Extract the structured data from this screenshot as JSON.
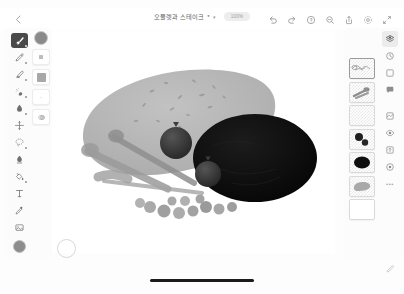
{
  "app": {
    "platform": "tablet-drawing-app",
    "background_color": "#fdfdfd"
  },
  "topbar": {
    "back_label": "‹",
    "back_icon": "chevron-left-icon",
    "document_title": "오믈렛과 스테이크",
    "title_modified_mark": "*",
    "title_caret": "▾",
    "zoom_level": "100%",
    "actions": [
      {
        "name": "undo",
        "icon": "undo-arrow-icon",
        "label": "실행 취소"
      },
      {
        "name": "redo",
        "icon": "redo-arrow-icon",
        "label": "다시 실행"
      },
      {
        "name": "help",
        "icon": "help-circle-icon",
        "label": "도움말"
      },
      {
        "name": "search",
        "icon": "search-zoom-icon",
        "label": "검색"
      },
      {
        "name": "share",
        "icon": "share-upload-icon",
        "label": "공유"
      },
      {
        "name": "settings",
        "icon": "gear-icon",
        "label": "설정"
      },
      {
        "name": "fullscreen",
        "icon": "expand-arrows-icon",
        "label": "전체 화면"
      }
    ]
  },
  "left_toolbar": {
    "tools": [
      {
        "name": "brush",
        "icon": "brush-icon",
        "label": "브러시",
        "active": true,
        "has_submenu": true
      },
      {
        "name": "pencil",
        "icon": "pencil-icon",
        "label": "연필",
        "active": false,
        "has_submenu": true
      },
      {
        "name": "marker",
        "icon": "marker-icon",
        "label": "마커",
        "active": false,
        "has_submenu": true
      },
      {
        "name": "airbrush",
        "icon": "airbrush-icon",
        "label": "에어브러시",
        "active": false,
        "has_submenu": true
      },
      {
        "name": "smudge",
        "icon": "smudge-icon",
        "label": "스머지",
        "active": false,
        "has_submenu": true
      },
      {
        "name": "transform",
        "icon": "transform-icon",
        "label": "변형",
        "active": false,
        "has_submenu": false
      },
      {
        "name": "selection",
        "icon": "lasso-select-icon",
        "label": "선택",
        "active": false,
        "has_submenu": true
      },
      {
        "name": "eraser",
        "icon": "eraser-icon",
        "label": "지우개",
        "active": false,
        "has_submenu": false
      },
      {
        "name": "fill",
        "icon": "paint-bucket-icon",
        "label": "채우기",
        "active": false,
        "has_submenu": true
      },
      {
        "name": "text",
        "icon": "text-tool-icon",
        "label": "텍스트",
        "active": false,
        "has_submenu": false
      },
      {
        "name": "eyedropper",
        "icon": "eyedropper-icon",
        "label": "스포이드",
        "active": false,
        "has_submenu": false
      },
      {
        "name": "image",
        "icon": "image-frame-icon",
        "label": "이미지",
        "active": false,
        "has_submenu": false
      }
    ],
    "color_swatch": {
      "name": "foreground-color",
      "color": "#8d8d8d",
      "label": "전경색"
    }
  },
  "tool_options": {
    "items": [
      {
        "name": "brush-color",
        "icon": "color-circle-icon",
        "color": "#8a8a8a",
        "label": "색상"
      },
      {
        "name": "brush-size",
        "icon": "size-square-icon",
        "label": "크기"
      },
      {
        "name": "brush-opacity",
        "icon": "opacity-square-icon",
        "label": "불투명도"
      },
      {
        "name": "brush-smoothing",
        "icon": "wave-tilde-icon",
        "value": "~",
        "label": "보정"
      },
      {
        "name": "brush-blend",
        "icon": "blend-mode-icon",
        "label": "혼합"
      }
    ]
  },
  "layers_panel": {
    "title": "레이어",
    "layers": [
      {
        "name": "layer-sketch",
        "label": "스케치",
        "thumb": "sketch-scribble",
        "selected": true
      },
      {
        "name": "layer-utensils",
        "label": "도구",
        "thumb": "gray-brush-strokes",
        "selected": false
      },
      {
        "name": "layer-empty",
        "label": "빈 레이어",
        "thumb": "empty",
        "selected": false
      },
      {
        "name": "layer-berries",
        "label": "베리",
        "thumb": "two-dark-circles",
        "selected": false
      },
      {
        "name": "layer-steak",
        "label": "스테이크",
        "thumb": "dark-oval",
        "selected": false
      },
      {
        "name": "layer-omelette",
        "label": "오믈렛",
        "thumb": "gray-blob",
        "selected": false
      },
      {
        "name": "layer-background",
        "label": "배경",
        "thumb": "white-fill",
        "selected": false
      }
    ]
  },
  "right_rail": {
    "items": [
      {
        "name": "layers",
        "icon": "layers-stack-icon",
        "label": "레이어",
        "active": true
      },
      {
        "name": "history",
        "icon": "history-clock-icon",
        "label": "기록",
        "active": false
      },
      {
        "name": "canvas",
        "icon": "canvas-frame-icon",
        "label": "캔버스",
        "active": false
      },
      {
        "name": "comments",
        "icon": "comment-bubble-icon",
        "label": "댓글",
        "active": false
      },
      {
        "name": "adjustments",
        "icon": "adjustments-icon",
        "label": "조정",
        "active": false
      },
      {
        "name": "visibility",
        "icon": "eye-icon",
        "label": "보기",
        "active": false
      },
      {
        "name": "export",
        "icon": "export-icon",
        "label": "내보내기",
        "active": false
      },
      {
        "name": "effects",
        "icon": "effects-target-icon",
        "label": "효과",
        "active": false
      },
      {
        "name": "more",
        "icon": "more-dots-icon",
        "value": "•••",
        "label": "더 보기",
        "active": false
      }
    ]
  },
  "canvas": {
    "name": "drawing-canvas",
    "artwork_title": "오믈렛과 스테이크",
    "shapes": [
      {
        "name": "omelette-blob",
        "color": "#b4b4b4",
        "description": "큰 밝은 회색 타원형 덩어리"
      },
      {
        "name": "steak-oval",
        "color": "#0d0d0d",
        "description": "어두운 타원"
      },
      {
        "name": "berry-large",
        "color": "#3a3a3a",
        "description": "큰 베리"
      },
      {
        "name": "berry-small",
        "color": "#3f3f3f",
        "description": "작은 베리"
      },
      {
        "name": "utensil-strokes",
        "color": "#9e9e9e",
        "description": "회색 길쭉한 도구 모양"
      },
      {
        "name": "pea-row",
        "color": "#a6a6a6",
        "description": "작은 구슬들의 줄"
      }
    ]
  },
  "bottom": {
    "color_wheel": {
      "name": "color-wheel-button",
      "label": "색상환"
    },
    "home_indicator": {
      "name": "home-indicator",
      "label": "홈 인디케이터"
    },
    "pen_pressure": {
      "name": "stylus-icon",
      "label": "스타일러스"
    }
  }
}
